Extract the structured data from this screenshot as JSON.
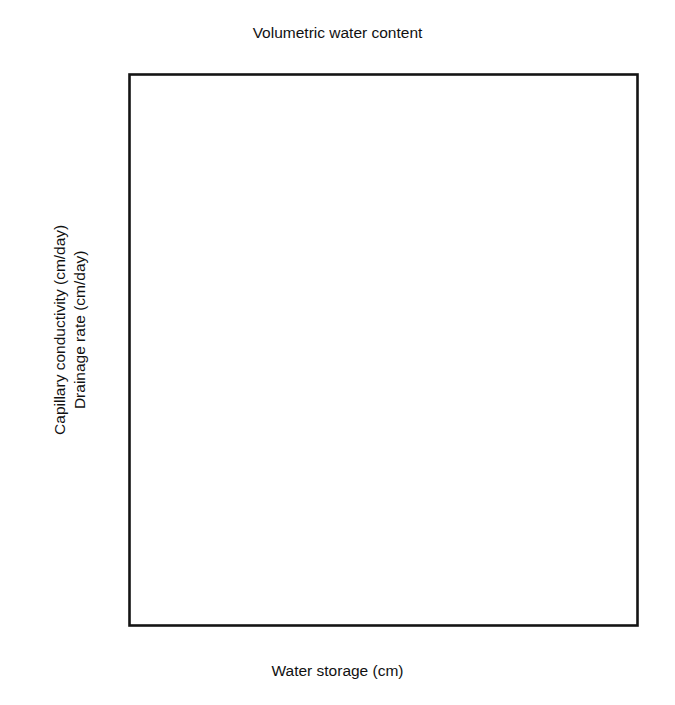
{
  "figure": {
    "background": "#ffffff",
    "ink": "#141414"
  },
  "axes": {
    "top": {
      "title": "Volumetric water content",
      "ticks": [
        "0.08",
        "0.09",
        "0.10",
        "0.11"
      ],
      "tick_values": [
        0.08,
        0.09,
        0.1,
        0.11
      ],
      "range": [
        0.0732,
        0.11
      ]
    },
    "bottom": {
      "title": "Water storage (cm)",
      "ticks": [
        "11",
        "12",
        "13",
        "14",
        "15",
        "16"
      ],
      "tick_values": [
        11,
        12,
        13,
        14,
        15,
        16
      ],
      "range": [
        11.0,
        16.9
      ]
    },
    "left": {
      "title_line1": "Capillary conductivity (cm/day)",
      "title_line2": "Drainage rate (cm/day)",
      "ticks": [
        "1.0",
        "0.1",
        "0.01"
      ],
      "tick_values": [
        1.0,
        0.1,
        0.01
      ],
      "scale": "log",
      "range": [
        0.01,
        1.0
      ]
    }
  },
  "chart_data": {
    "type": "scatter",
    "title": "",
    "xlabel": "Water storage (cm)",
    "ylabel": "Capillary conductivity (cm/day) / Drainage rate (cm/day)",
    "xlabel_secondary": "Volumetric water content",
    "xlim": [
      11.0,
      16.9
    ],
    "ylim": [
      0.01,
      1.0
    ],
    "yscale": "log",
    "grid": false,
    "legend": "none",
    "series": [
      {
        "name": "open-circle",
        "marker": "open-circle",
        "points": [
          [
            11.28,
            0.0148
          ],
          [
            11.42,
            0.0148
          ],
          [
            11.31,
            0.0345
          ],
          [
            11.48,
            0.0345
          ],
          [
            11.82,
            0.0345
          ],
          [
            11.88,
            0.0425
          ],
          [
            12.02,
            0.0385
          ],
          [
            12.12,
            0.036
          ],
          [
            12.2,
            0.0338
          ],
          [
            12.33,
            0.0342
          ],
          [
            12.22,
            0.0508
          ],
          [
            12.58,
            0.0576
          ],
          [
            13.12,
            0.099
          ],
          [
            13.18,
            0.101
          ],
          [
            13.36,
            0.141
          ],
          [
            13.52,
            0.1345
          ],
          [
            13.7,
            0.1355
          ],
          [
            13.9,
            0.1535
          ],
          [
            14.3,
            0.176
          ],
          [
            14.42,
            0.1775
          ],
          [
            14.1,
            0.125
          ],
          [
            14.24,
            0.201
          ],
          [
            14.62,
            0.166
          ],
          [
            14.78,
            0.233
          ],
          [
            14.88,
            0.214
          ],
          [
            15.02,
            0.223
          ],
          [
            15.1,
            0.231
          ],
          [
            15.2,
            0.215
          ],
          [
            15.44,
            0.3
          ],
          [
            15.55,
            0.41
          ],
          [
            15.42,
            0.522
          ],
          [
            15.88,
            0.36
          ],
          [
            15.8,
            0.48
          ],
          [
            16.12,
            0.765
          ],
          [
            16.42,
            0.75
          ]
        ]
      },
      {
        "name": "filled-circle",
        "marker": "filled-circle",
        "points": [
          [
            14.95,
            0.224
          ],
          [
            15.26,
            0.269
          ],
          [
            15.82,
            0.241
          ]
        ]
      },
      {
        "name": "open-square",
        "marker": "open-square",
        "points": [
          [
            13.06,
            0.101
          ],
          [
            13.3,
            0.1455
          ],
          [
            14.2,
            0.173
          ],
          [
            14.7,
            0.301
          ],
          [
            15.18,
            0.333
          ],
          [
            16.82,
            0.93
          ]
        ]
      },
      {
        "name": "open-triangle",
        "marker": "open-triangle",
        "points": [
          [
            12.86,
            0.201
          ]
        ]
      }
    ],
    "fit_line": {
      "name": "regression-line",
      "x_start": 11.0,
      "y_start": 0.0197,
      "x_end": 16.88,
      "y_end": 0.945
    }
  }
}
